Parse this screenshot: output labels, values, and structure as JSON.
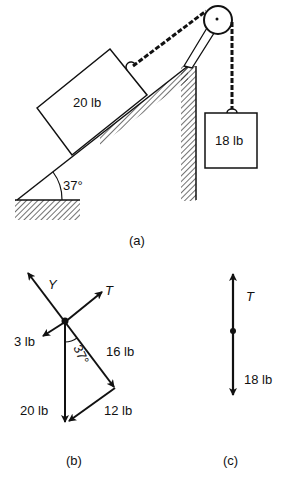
{
  "figure_a": {
    "caption": "(a)",
    "block_incline_label": "20 lb",
    "block_hanging_label": "18 lb",
    "angle_label": "37°"
  },
  "figure_b": {
    "caption": "(b)",
    "normal_label": "Y",
    "tension_label": "T",
    "friction_label": "3 lb",
    "component_parallel_label": "16 lb",
    "component_perp_label": "12 lb",
    "weight_label": "20 lb",
    "angle_label": "37°"
  },
  "figure_c": {
    "caption": "(c)",
    "tension_label": "T",
    "weight_label": "18 lb"
  },
  "colors": {
    "ink": "#111111",
    "background": "#ffffff"
  }
}
